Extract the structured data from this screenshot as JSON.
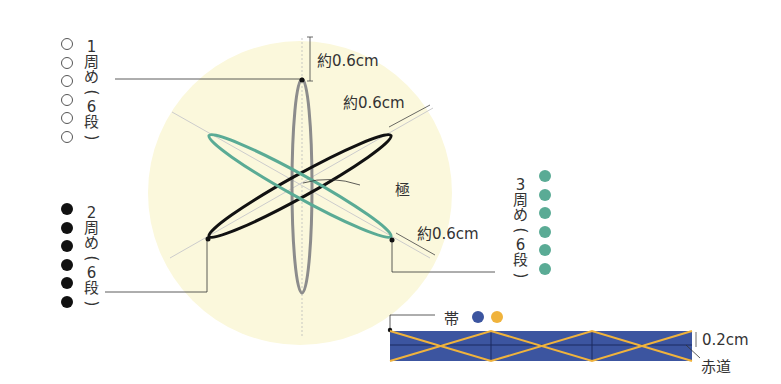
{
  "colors": {
    "background_circle": "#fbf8dc",
    "round1": "#8c8c8c",
    "round2": "#111111",
    "round3": "#5aab95",
    "band": "#3c55a0",
    "band_cross": "#f0b33c"
  },
  "round1": {
    "number": "1",
    "chars": [
      "周",
      "め",
      "(",
      "6",
      "段",
      ")"
    ],
    "dot_style": "open",
    "dot_count": 6
  },
  "round2": {
    "number": "2",
    "chars": [
      "周",
      "め",
      "(",
      "6",
      "段",
      ")"
    ],
    "dot_style": "black",
    "dot_count": 6
  },
  "round3": {
    "number": "3",
    "chars": [
      "周",
      "め",
      "(",
      "6",
      "段",
      ")"
    ],
    "dot_style": "teal",
    "dot_count": 6
  },
  "labels": {
    "width_top": "約0.6cm",
    "width_diag_upper": "約0.6cm",
    "width_diag_lower": "約0.6cm",
    "pole": "極",
    "band": "帯",
    "band_height": "0.2cm",
    "equator": "赤道"
  }
}
